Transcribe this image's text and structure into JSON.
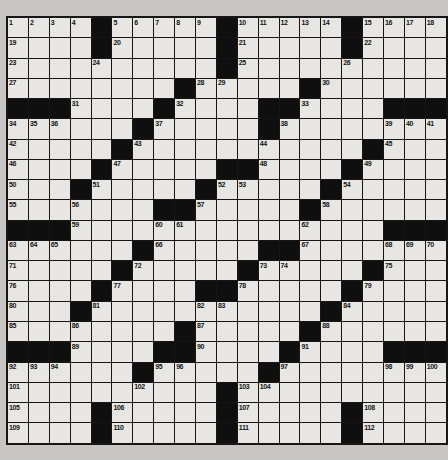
{
  "puzzle": {
    "title": "crossword-grid",
    "rows": 21,
    "cols": 21,
    "grid": [
      "....#.....#.....#....",
      "....#.....#.....#....",
      "..........#..........",
      "........#.....#......",
      "###....#....##....###",
      "......#.....#........",
      ".....#...........#...",
      "....#.....##....#....",
      "...#.....#.....#.....",
      ".......##.....#......",
      "###...............###",
      "......#.....##.......",
      ".....#.....#.....#...",
      "....#....##.....#....",
      "...#...........#.....",
      "........#.....#......",
      "###....##....#....###",
      "......#.....#........",
      "..........#..........",
      "....#.....#.....#....",
      "....#.....#.....#...."
    ],
    "numbers": {
      "0,0": "1",
      "0,1": "2",
      "0,2": "3",
      "0,3": "4",
      "0,5": "5",
      "0,6": "6",
      "0,7": "7",
      "0,8": "8",
      "0,9": "9",
      "0,11": "10",
      "0,12": "11",
      "0,13": "12",
      "0,14": "13",
      "0,15": "14",
      "0,17": "15",
      "0,18": "16",
      "0,19": "17",
      "0,20": "18",
      "1,0": "19",
      "1,5": "20",
      "1,11": "21",
      "1,17": "22",
      "2,0": "23",
      "2,4": "24",
      "2,11": "25",
      "2,16": "26",
      "3,0": "27",
      "3,9": "28",
      "3,10": "29",
      "3,15": "30",
      "4,3": "31",
      "4,8": "32",
      "4,14": "33",
      "5,0": "34",
      "5,1": "35",
      "5,2": "36",
      "5,7": "37",
      "5,13": "38",
      "5,18": "39",
      "5,19": "40",
      "5,20": "41",
      "6,0": "42",
      "6,6": "43",
      "6,12": "44",
      "6,18": "45",
      "7,0": "46",
      "7,5": "47",
      "7,12": "48",
      "7,17": "49",
      "8,0": "50",
      "8,4": "51",
      "8,10": "52",
      "8,11": "53",
      "8,16": "54",
      "9,0": "55",
      "9,3": "56",
      "9,9": "57",
      "9,15": "58",
      "10,3": "59",
      "10,7": "60",
      "10,8": "61",
      "10,14": "62",
      "11,0": "63",
      "11,1": "64",
      "11,2": "65",
      "11,7": "66",
      "11,14": "67",
      "11,18": "68",
      "11,19": "69",
      "11,20": "70",
      "12,0": "71",
      "12,6": "72",
      "12,12": "73",
      "12,13": "74",
      "12,18": "75",
      "13,0": "76",
      "13,5": "77",
      "13,11": "78",
      "13,17": "79",
      "14,0": "80",
      "14,4": "81",
      "14,9": "82",
      "14,10": "83",
      "14,16": "84",
      "15,0": "85",
      "15,3": "86",
      "15,9": "87",
      "15,15": "88",
      "16,3": "89",
      "16,9": "90",
      "16,14": "91",
      "17,0": "92",
      "17,1": "93",
      "17,2": "94",
      "17,7": "95",
      "17,8": "96",
      "17,13": "97",
      "17,18": "98",
      "17,19": "99",
      "17,20": "100",
      "18,0": "101",
      "18,6": "102",
      "18,11": "103",
      "18,12": "104",
      "19,0": "105",
      "19,5": "106",
      "19,11": "107",
      "19,17": "108",
      "20,0": "109",
      "20,5": "110",
      "20,11": "111",
      "20,17": "112"
    },
    "colors": {
      "page_background": "#c7c6c3",
      "cell_fill": "#e7e6e2",
      "black_cell": "#0f0f0f",
      "grid_line": "#161616",
      "number_color": "#141414"
    }
  }
}
